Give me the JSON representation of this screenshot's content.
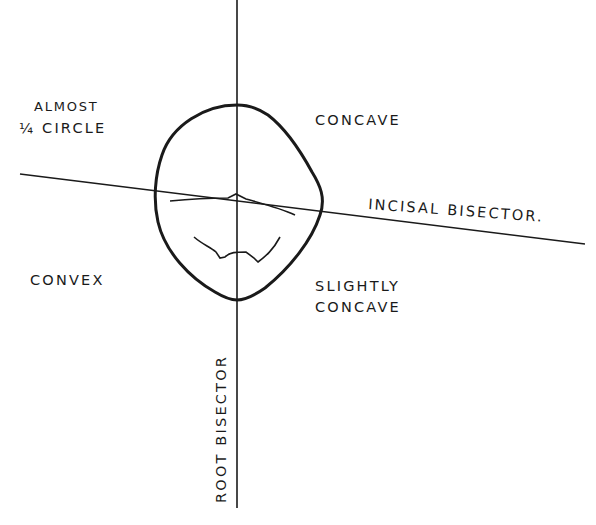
{
  "figure": {
    "type": "line-drawing",
    "labels": {
      "top_left_line1": "ALMOST",
      "top_left_line2": "¼ CIRCLE",
      "top_right": "CONCAVE",
      "bottom_left": "CONVEX",
      "bottom_right_line1": "SLIGHTLY",
      "bottom_right_line2": "CONCAVE",
      "incisal_line": "INCISAL BISECTOR.",
      "root_line": "ROOT BISECTOR"
    },
    "caption": {
      "partially_visible": true,
      "text": ""
    },
    "colors": {
      "ink": "#1a1a1a",
      "paper": "#ffffff"
    }
  }
}
